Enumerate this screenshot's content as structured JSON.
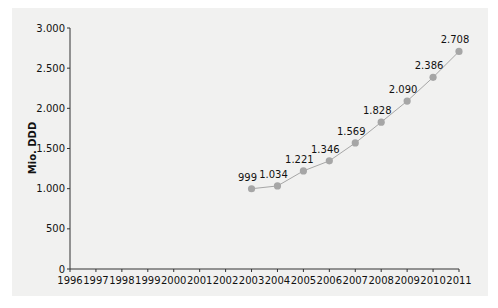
{
  "chart_data": {
    "type": "line",
    "title": "",
    "xlabel": "",
    "ylabel": "Mio. DDD",
    "ylim": [
      0,
      3000
    ],
    "xlim": [
      1996,
      2011
    ],
    "grid": false,
    "legend": null,
    "x_ticks": [
      "1996",
      "1997",
      "1998",
      "1999",
      "2000",
      "2001",
      "2002",
      "2003",
      "2004",
      "2005",
      "2006",
      "2007",
      "2008",
      "2009",
      "2010",
      "2011"
    ],
    "y_ticks": [
      "0",
      "500",
      "1.000",
      "1.500",
      "2.000",
      "2.500",
      "3.000"
    ],
    "y_tick_values": [
      0,
      500,
      1000,
      1500,
      2000,
      2500,
      3000
    ],
    "series": [
      {
        "name": "Mio. DDD",
        "x": [
          2003,
          2004,
          2005,
          2006,
          2007,
          2008,
          2009,
          2010,
          2011
        ],
        "values": [
          999,
          1034,
          1221,
          1346,
          1569,
          1828,
          2090,
          2386,
          2708
        ],
        "labels": [
          "999",
          "1.034",
          "1.221",
          "1.346",
          "1.569",
          "1.828",
          "2.090",
          "2.386",
          "2.708"
        ],
        "color": "#a6a6a6",
        "line_color": "#a6a6a6"
      }
    ],
    "colors": {
      "panel_bg": "#f1f1f0",
      "axis": "#333333",
      "marker": "#a6a6a6"
    }
  }
}
